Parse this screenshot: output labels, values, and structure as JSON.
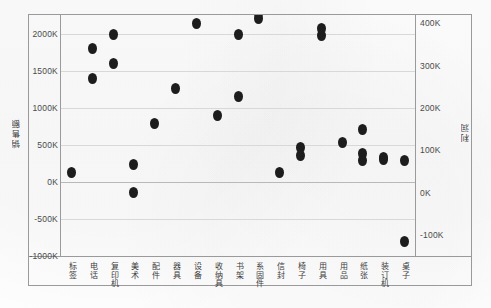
{
  "chart_data": {
    "type": "scatter",
    "title": "",
    "xlabel": "",
    "ylabel": "销售额",
    "y2label": "利润",
    "categories": [
      "标签",
      "电话",
      "复印机",
      "美术",
      "配件",
      "器具",
      "设备",
      "收纳具",
      "书架",
      "系固件",
      "信封",
      "椅子",
      "用具",
      "用品",
      "纸张",
      "装订机",
      "桌子"
    ],
    "ylim": [
      -1000000,
      2250000
    ],
    "y2lim": [
      -150000,
      420000
    ],
    "yticks": [
      "2000K",
      "1500K",
      "1000K",
      "500K",
      "0K",
      "-500K",
      "-1000K"
    ],
    "ytick_values": [
      2000000,
      1500000,
      1000000,
      500000,
      0,
      -500000,
      -1000000
    ],
    "y2ticks": [
      "400K",
      "300K",
      "200K",
      "100K",
      "0K",
      "-100K"
    ],
    "y2tick_values": [
      400000,
      300000,
      200000,
      100000,
      0,
      -100000
    ],
    "grid": true,
    "legend": "none",
    "marker_color": "#1d1d1d",
    "grid_color": "#d8d8d8",
    "border_color": "#9a9a9a",
    "series": [
      {
        "name": "销售额",
        "axis": "left",
        "points": [
          {
            "category": "标签",
            "value": 120000
          },
          {
            "category": "电话",
            "value": 1800000
          },
          {
            "category": "电话",
            "value": 1400000
          },
          {
            "category": "复印机",
            "value": 1990000
          },
          {
            "category": "复印机",
            "value": 1600000
          },
          {
            "category": "美术",
            "value": 230000
          },
          {
            "category": "美术",
            "value": -140000
          },
          {
            "category": "配件",
            "value": 790000
          },
          {
            "category": "器具",
            "value": 1260000
          },
          {
            "category": "设备",
            "value": 2130000
          },
          {
            "category": "收纳具",
            "value": 900000
          },
          {
            "category": "书架",
            "value": 1150000
          },
          {
            "category": "书架",
            "value": 1990000
          },
          {
            "category": "系固件",
            "value": 2200000
          },
          {
            "category": "系固件",
            "value": 2270000
          },
          {
            "category": "信封",
            "value": 130000
          },
          {
            "category": "椅子",
            "value": 470000
          },
          {
            "category": "椅子",
            "value": 350000
          },
          {
            "category": "用具",
            "value": 1980000
          },
          {
            "category": "用具",
            "value": 2070000
          },
          {
            "category": "用品",
            "value": 530000
          },
          {
            "category": "纸张",
            "value": 290000
          },
          {
            "category": "纸张",
            "value": 380000
          },
          {
            "category": "装订机",
            "value": 330000
          },
          {
            "category": "装订机",
            "value": 300000
          },
          {
            "category": "桌子",
            "value": 295000
          }
        ]
      },
      {
        "name": "利润",
        "axis": "right",
        "points": [
          {
            "category": "纸张",
            "value": 150000
          },
          {
            "category": "桌子",
            "value": -115000
          }
        ]
      }
    ]
  },
  "axes": {
    "left_title": "销售额",
    "right_title": "利润"
  }
}
